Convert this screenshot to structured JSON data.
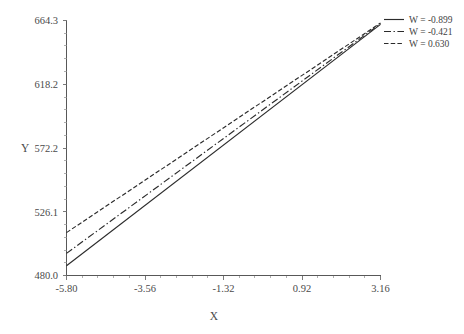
{
  "chart_data": {
    "type": "line",
    "title": "",
    "xlabel": "X",
    "ylabel": "Y",
    "xlim": [
      -5.8,
      3.16
    ],
    "ylim": [
      480.0,
      664.3
    ],
    "grid": false,
    "legend_position": "top-right",
    "xticks": [
      "-5.80",
      "-3.56",
      "-1.32",
      "0.92",
      "3.16"
    ],
    "xtick_values": [
      -5.8,
      -3.56,
      -1.32,
      0.92,
      3.16
    ],
    "yticks": [
      "480.0",
      "526.1",
      "572.2",
      "618.2",
      "664.3"
    ],
    "ytick_values": [
      480.0,
      526.1,
      572.2,
      618.2,
      664.3
    ],
    "minor_ticks_per_interval": 4,
    "x": [
      -5.8,
      3.16
    ],
    "series": [
      {
        "name": "W = -0.899",
        "label": "W = -0.899",
        "w_value": -0.899,
        "style": "solid",
        "color": "#2b2b2b",
        "values": [
          487.0,
          661.5
        ]
      },
      {
        "name": "W = -0.421",
        "label": "W = -0.421",
        "w_value": -0.421,
        "style": "dash-dot",
        "color": "#2b2b2b",
        "values": [
          496.0,
          662.0
        ]
      },
      {
        "name": "W = 0.630",
        "label": "W = 0.630",
        "w_value": 0.63,
        "style": "fine-dash",
        "color": "#2b2b2b",
        "values": [
          511.0,
          662.5
        ]
      }
    ]
  },
  "axes": {
    "y_axis_title": "Y",
    "x_axis_title": "X",
    "y_tick_labels": [
      "664.3",
      "618.2",
      "572.2",
      "526.1",
      "480.0"
    ],
    "x_tick_labels": [
      "-5.80",
      "-3.56",
      "-1.32",
      "0.92",
      "3.16"
    ]
  },
  "legend": {
    "entries": [
      {
        "label": "W = -0.899"
      },
      {
        "label": "W = -0.421"
      },
      {
        "label": "W = 0.630"
      }
    ]
  },
  "colors": {
    "line": "#2b2b2b",
    "axis": "#585858",
    "text": "#4a4a4a",
    "background": "#ffffff"
  }
}
